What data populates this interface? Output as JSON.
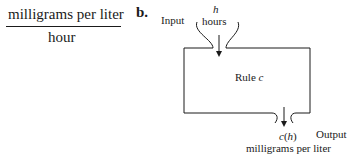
{
  "left_expression": {
    "numerator": "milligrams per liter",
    "denominator": "hour"
  },
  "part_b": {
    "label": "b.",
    "diagram": {
      "input_label": "Input",
      "input_variable": "h",
      "input_units": "hours",
      "rule_label": "Rule",
      "rule_name": "c",
      "output_label": "Output",
      "output_expression_fn": "c",
      "output_expression_arg": "h",
      "output_units": "milligrams per liter"
    }
  }
}
